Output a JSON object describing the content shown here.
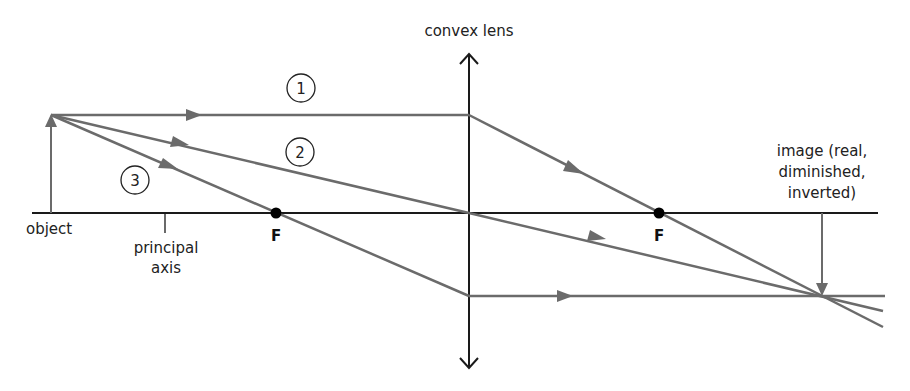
{
  "diagram": {
    "labels": {
      "lens": "convex lens",
      "object": "object",
      "axis_line1": "principal",
      "axis_line2": "axis",
      "focus_left": "F",
      "focus_right": "F",
      "image_line1": "image (real,",
      "image_line2": "diminished,",
      "image_line3": "inverted)"
    },
    "ray_numbers": [
      "1",
      "2",
      "3"
    ],
    "colors": {
      "ray": "#6b6b6b",
      "axis": "#1a1a1a",
      "lens": "#1a1a1a",
      "focus_point": "#000000",
      "text": "#222222"
    },
    "geometry": {
      "axis_y": 213,
      "axis_x_start": 32,
      "axis_x_end": 878,
      "lens_x": 469,
      "lens_top": 52,
      "lens_bottom": 370,
      "object": {
        "x": 51,
        "base_y": 213,
        "tip_y": 115
      },
      "focus_left": {
        "x": 276,
        "y": 213
      },
      "focus_right": {
        "x": 659,
        "y": 213
      },
      "image": {
        "x": 822,
        "base_y": 213,
        "tip_y": 296
      },
      "axis_tick_x": 165
    }
  }
}
